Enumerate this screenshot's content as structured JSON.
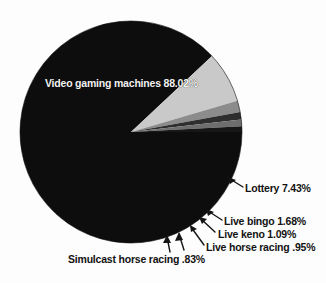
{
  "chart_data": {
    "type": "pie",
    "title": "",
    "subtitle": "",
    "xlabel": "",
    "ylabel": "",
    "legend_position": "none",
    "grid": false,
    "labels_show_percent": true,
    "categories": [
      "Video gaming machines",
      "Lottery",
      "Live bingo",
      "Live keno",
      "Live horse racing",
      "Simulcast horse racing"
    ],
    "values": [
      88.02,
      7.43,
      1.68,
      1.09,
      0.95,
      0.83
    ],
    "value_strings": [
      "88.02%",
      "7.43%",
      "1.68%",
      "1.09%",
      ".95%",
      ".83%"
    ],
    "slice_colors": [
      "#0d0d0d",
      "#c9c9c9",
      "#8c8c8c",
      "#2e2e2e",
      "#6e6e6e",
      "#171717"
    ],
    "slices": [
      {
        "name": "Video gaming machines",
        "value": 88.02,
        "value_text": "88.02%",
        "color": "#0d0d0d",
        "label_text": "Video gaming machines 88.02%",
        "label_placement": "inside"
      },
      {
        "name": "Lottery",
        "value": 7.43,
        "value_text": "7.43%",
        "color": "#c9c9c9",
        "label_text": "Lottery  7.43%",
        "label_placement": "callout"
      },
      {
        "name": "Live bingo",
        "value": 1.68,
        "value_text": "1.68%",
        "color": "#8c8c8c",
        "label_text": "Live bingo  1.68%",
        "label_placement": "callout"
      },
      {
        "name": "Live keno",
        "value": 1.09,
        "value_text": "1.09%",
        "color": "#2e2e2e",
        "label_text": "Live keno  1.09%",
        "label_placement": "callout"
      },
      {
        "name": "Live horse racing",
        "value": 0.95,
        "value_text": ".95%",
        "color": "#6e6e6e",
        "label_text": "Live horse racing .95%",
        "label_placement": "callout"
      },
      {
        "name": "Simulcast horse racing",
        "value": 0.83,
        "value_text": ".83%",
        "color": "#171717",
        "label_text": "Simulcast horse racing  .83%",
        "label_placement": "callout"
      }
    ],
    "total": 100.0,
    "background_color": "#fdfdfd",
    "geometry": {
      "center_x": 131,
      "center_y": 132,
      "radius": 111,
      "start_angle_deg": 0
    }
  },
  "labels": {
    "video_gaming_machines": "Video gaming machines 88.02%",
    "lottery": "Lottery  7.43%",
    "live_bingo": "Live bingo  1.68%",
    "live_keno": "Live keno  1.09%",
    "live_horse_racing": "Live horse racing .95%",
    "simulcast_horse_racing": "Simulcast horse racing  .83%"
  }
}
